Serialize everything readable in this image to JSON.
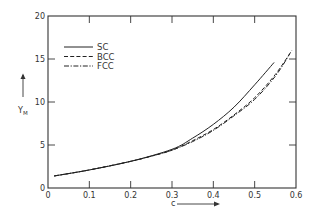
{
  "chart_data": {
    "type": "line",
    "title": "",
    "xlabel": "c",
    "ylabel": "Y_M",
    "ylabel_main": "Y",
    "ylabel_sub": "M",
    "xlim": [
      0,
      0.6
    ],
    "ylim": [
      0,
      20
    ],
    "xticks": [
      "0",
      "0.1",
      "0.2",
      "0.3",
      "0.4",
      "0.5",
      "0.6"
    ],
    "yticks": [
      "0",
      "5",
      "10",
      "15",
      "20"
    ],
    "grid": false,
    "legend_position": "upper-left",
    "series": [
      {
        "name": "SC",
        "style": "solid",
        "x": [
          0.015,
          0.1,
          0.2,
          0.3,
          0.35,
          0.4,
          0.45,
          0.5,
          0.547
        ],
        "y": [
          1.4,
          2.1,
          3.1,
          4.5,
          5.8,
          7.4,
          9.4,
          12.0,
          14.6
        ]
      },
      {
        "name": "BCC",
        "style": "dashed",
        "x": [
          0.015,
          0.1,
          0.2,
          0.25,
          0.3,
          0.35,
          0.4,
          0.45,
          0.5,
          0.55,
          0.59
        ],
        "y": [
          1.4,
          2.1,
          3.1,
          3.7,
          4.4,
          5.5,
          6.8,
          8.5,
          10.5,
          13.2,
          16.0
        ]
      },
      {
        "name": "FCC",
        "style": "dash-dot",
        "x": [
          0.015,
          0.1,
          0.2,
          0.25,
          0.3,
          0.35,
          0.4,
          0.45,
          0.5,
          0.55,
          0.585
        ],
        "y": [
          1.4,
          2.1,
          3.1,
          3.7,
          4.4,
          5.4,
          6.7,
          8.4,
          10.3,
          13.0,
          15.6
        ]
      }
    ]
  },
  "legend": {
    "items": [
      {
        "label": "SC",
        "style": "solid"
      },
      {
        "label": "BCC",
        "style": "dashed"
      },
      {
        "label": "FCC",
        "style": "dash-dot"
      }
    ]
  },
  "colors": {
    "line": "#222222",
    "axis": "#333333",
    "background": "#ffffff"
  }
}
